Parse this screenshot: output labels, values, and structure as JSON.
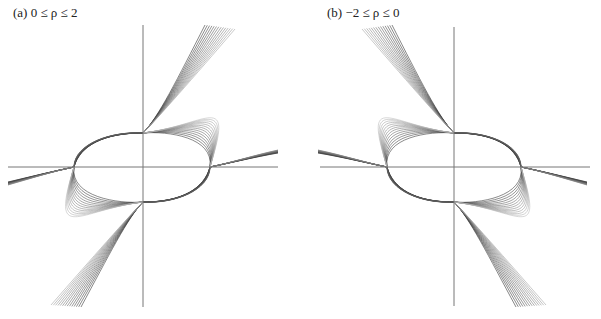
{
  "figure": {
    "panels": [
      {
        "id": "a",
        "label": "(a) 0 ≤ ρ ≤ 2",
        "mirror": false,
        "axes": {
          "x_axis": {
            "y": 167,
            "x1": 8,
            "x2": 278
          },
          "y_axis": {
            "x": 143,
            "y1": 25,
            "y2": 307
          }
        },
        "nodes": {
          "left": [
            74,
            167
          ],
          "top": [
            143,
            133
          ],
          "right": [
            210,
            167
          ],
          "bottom": [
            143,
            202
          ]
        }
      },
      {
        "id": "b",
        "label": "(b) −2 ≤ ρ ≤ 0",
        "mirror": true,
        "axes": {
          "x_axis": {
            "y": 167,
            "x1": 19,
            "x2": 289
          },
          "y_axis": {
            "x": 153,
            "y1": 27,
            "y2": 306
          }
        },
        "nodes": {
          "left": [
            86,
            167
          ],
          "top": [
            153,
            133
          ],
          "right": [
            220,
            167
          ],
          "bottom": [
            153,
            202
          ]
        }
      }
    ],
    "curve_count": 14,
    "colors": {
      "axis": "#777777",
      "curve_dark": "#1a1a1a",
      "curve_light": "#bbbbbb",
      "background": "#ffffff"
    }
  }
}
